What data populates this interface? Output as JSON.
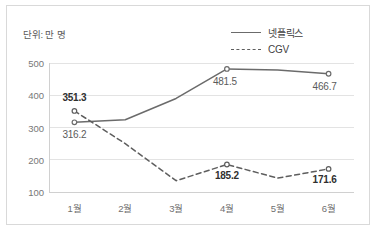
{
  "unit_note": "단위: 만 명",
  "legend": {
    "position": "top-right",
    "entries": [
      {
        "label": "넷플릭스",
        "style": "solid",
        "icon": "solid-line-icon"
      },
      {
        "label": "CGV",
        "style": "dashed",
        "icon": "dashed-line-icon"
      }
    ]
  },
  "colors": {
    "netflix_line": "#6b6b6b",
    "cgv_line": "#5e5e5e",
    "gridline": "#e3e3e3",
    "axis": "#d0d0d0",
    "frame": "#d9d9d9",
    "label_netflix": "#5b5b5b",
    "label_cgv": "#2f2f2f"
  },
  "chart_data": {
    "type": "line",
    "title": "",
    "subtitle": "",
    "xlabel": "",
    "ylabel": "",
    "unit": "만 명",
    "categories": [
      "1월",
      "2월",
      "3월",
      "4월",
      "5월",
      "6월"
    ],
    "ylim": [
      100,
      500
    ],
    "yticks": [
      100,
      200,
      300,
      400,
      500
    ],
    "ytick_labels": [
      "100",
      "200",
      "300",
      "400",
      "500"
    ],
    "grid": true,
    "legend_position": "top-right",
    "series": [
      {
        "name": "넷플릭스",
        "style": "solid",
        "marker": "open-circle",
        "values": [
          316.2,
          324.0,
          390.0,
          481.5,
          478.0,
          466.7
        ],
        "labels": [
          {
            "index": 0,
            "text": "316.2"
          },
          {
            "index": 3,
            "text": "481.5"
          },
          {
            "index": 5,
            "text": "466.7"
          }
        ]
      },
      {
        "name": "CGV",
        "style": "dashed",
        "marker": "open-circle",
        "values": [
          351.3,
          250.0,
          135.0,
          185.2,
          143.0,
          171.6
        ],
        "labels": [
          {
            "index": 0,
            "text": "351.3"
          },
          {
            "index": 3,
            "text": "185.2"
          },
          {
            "index": 5,
            "text": "171.6"
          }
        ]
      }
    ]
  }
}
